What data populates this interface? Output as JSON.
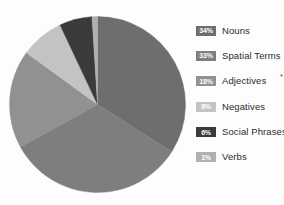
{
  "chart_data": {
    "type": "pie",
    "title": "",
    "categories": [
      "Nouns",
      "Spatial Terms",
      "Adjectives",
      "Negatives",
      "Social Phrases",
      "Verbs"
    ],
    "values": [
      34,
      33,
      18,
      8,
      6,
      1
    ],
    "value_labels": [
      "34%",
      "33%",
      "18%",
      "8%",
      "6%",
      "1%"
    ],
    "unit": "%",
    "start_angle": 0,
    "direction": "clockwise",
    "legend_position": "right",
    "grid": false,
    "slice_colors": [
      "#6e6e6e",
      "#7e7e7e",
      "#919191",
      "#c3c3c3",
      "#3a3a3a",
      "#b0b0b0"
    ],
    "annotations": [
      {
        "category": "Adjectives",
        "marker": "*"
      }
    ]
  },
  "legend": {
    "items": [
      {
        "pct": "34%",
        "label": "Nouns",
        "color": "#6e6e6e",
        "marker": ""
      },
      {
        "pct": "33%",
        "label": "Spatial Terms",
        "color": "#7e7e7e",
        "marker": ""
      },
      {
        "pct": "18%",
        "label": "Adjectives",
        "color": "#919191",
        "marker": "*"
      },
      {
        "pct": "8%",
        "label": "Negatives",
        "color": "#c3c3c3",
        "marker": ""
      },
      {
        "pct": "6%",
        "label": "Social Phrases",
        "color": "#3a3a3a",
        "marker": ""
      },
      {
        "pct": "1%",
        "label": "Verbs",
        "color": "#b0b0b0",
        "marker": ""
      }
    ]
  },
  "colors": {
    "background": "#fdfdfd",
    "label_text": "#2b2b2b",
    "swatch_text": "#ffffff"
  }
}
